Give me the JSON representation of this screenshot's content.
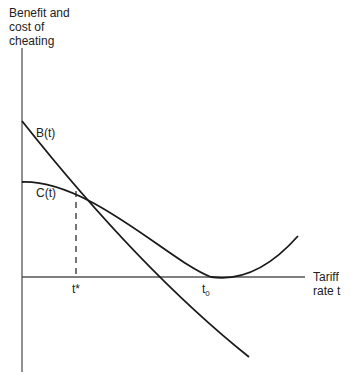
{
  "diagram": {
    "y_axis_label_lines": [
      "Benefit and",
      "cost of",
      "cheating"
    ],
    "x_axis_label_lines": [
      "Tariff",
      "rate t"
    ],
    "curves": [
      {
        "name": "B(t)",
        "label": "B(t)",
        "description": "Benefit of cheating, decreasing in tariff rate"
      },
      {
        "name": "C(t)",
        "label": "C(t)",
        "description": "Cost of cheating, decreasing then rising, minimum zero at t0"
      }
    ],
    "tick_labels": {
      "t_star": "t*",
      "t0_base": "t",
      "t0_sub": "0"
    },
    "annotations": {
      "dashed_line": "Vertical dashed line from B(t)=C(t) intersection down to t*"
    },
    "colors": {
      "axis": "#555555",
      "curve": "#1a1a1a",
      "background": "#ffffff"
    }
  }
}
